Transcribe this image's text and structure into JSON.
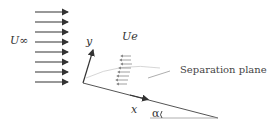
{
  "labels": {
    "freestream": "U∞",
    "edge_velocity": "Ue",
    "y_axis": "y",
    "x_axis": "x",
    "angle": "α",
    "separation": "Separation plane"
  },
  "colors": {
    "line": "#333333",
    "faint": "#bbbbbb"
  }
}
